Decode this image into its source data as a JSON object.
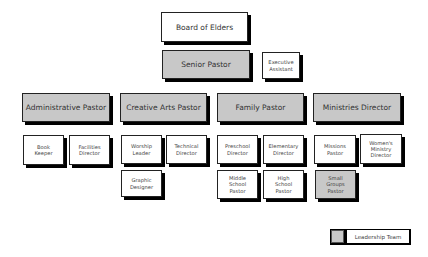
{
  "chart": {
    "top": {
      "board": "Board of Elders",
      "senior": "Senior Pastor",
      "assistant": "Executive\nAssistant"
    },
    "departments": [
      {
        "label": "Administrative Pastor",
        "leadership": true
      },
      {
        "label": "Creative Arts Pastor",
        "leadership": true
      },
      {
        "label": "Family Pastor",
        "leadership": true
      },
      {
        "label": "Ministries Director",
        "leadership": true
      }
    ],
    "staff": {
      "admin": [
        "Book\nKeeper",
        "Facilities\nDirector"
      ],
      "creative": [
        "Worship\nLeader",
        "Technical\nDirector",
        "Graphic\nDesigner"
      ],
      "family": [
        "Preschool\nDirector",
        "Elementary\nDirector",
        "Middle\nSchool\nPastor",
        "High\nSchool\nPastor"
      ],
      "ministries": [
        "Missions\nPastor",
        "Women's\nMinistry\nDirector",
        "Small\nGroups\nPastor"
      ]
    },
    "legend": {
      "label": "Leadership Team",
      "swatch_color": "#c8c8c8"
    }
  }
}
